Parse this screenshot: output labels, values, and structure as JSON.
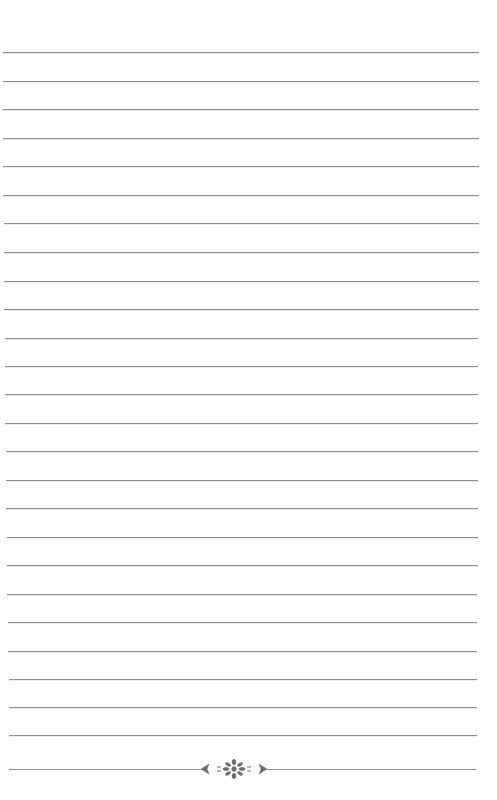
{
  "page": {
    "type": "lined-paper",
    "background": "#ffffff",
    "line_color": "#8e8e8e",
    "rule_count": 25,
    "rules": [
      {
        "y": 52,
        "x1": 3,
        "x2": 479
      },
      {
        "y": 81,
        "x1": 3,
        "x2": 479
      },
      {
        "y": 109,
        "x1": 3,
        "x2": 479
      },
      {
        "y": 138,
        "x1": 3,
        "x2": 479
      },
      {
        "y": 166,
        "x1": 3,
        "x2": 479
      },
      {
        "y": 195,
        "x1": 3,
        "x2": 479
      },
      {
        "y": 223,
        "x1": 4,
        "x2": 479
      },
      {
        "y": 252,
        "x1": 4,
        "x2": 479
      },
      {
        "y": 281,
        "x1": 4,
        "x2": 479
      },
      {
        "y": 309,
        "x1": 4,
        "x2": 479
      },
      {
        "y": 338,
        "x1": 5,
        "x2": 478
      },
      {
        "y": 366,
        "x1": 5,
        "x2": 478
      },
      {
        "y": 394,
        "x1": 5,
        "x2": 478
      },
      {
        "y": 423,
        "x1": 5,
        "x2": 478
      },
      {
        "y": 451,
        "x1": 6,
        "x2": 478
      },
      {
        "y": 480,
        "x1": 6,
        "x2": 478
      },
      {
        "y": 508,
        "x1": 6,
        "x2": 478
      },
      {
        "y": 537,
        "x1": 7,
        "x2": 478
      },
      {
        "y": 565,
        "x1": 7,
        "x2": 478
      },
      {
        "y": 594,
        "x1": 7,
        "x2": 477
      },
      {
        "y": 622,
        "x1": 8,
        "x2": 477
      },
      {
        "y": 651,
        "x1": 8,
        "x2": 477
      },
      {
        "y": 679,
        "x1": 9,
        "x2": 477
      },
      {
        "y": 707,
        "x1": 9,
        "x2": 477
      },
      {
        "y": 735,
        "x1": 9,
        "x2": 477
      }
    ],
    "footer": {
      "y": 769,
      "left_line": {
        "x1": 9,
        "x2": 201
      },
      "right_line": {
        "x1": 267,
        "x2": 476
      },
      "ornament": "floral-divider-icon",
      "ornament_color": "#6e6e6e"
    }
  }
}
